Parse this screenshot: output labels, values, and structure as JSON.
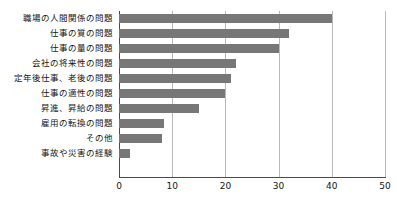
{
  "chart_data": {
    "type": "bar",
    "orientation": "horizontal",
    "title": "",
    "xlabel": "",
    "ylabel": "",
    "xlim": [
      0,
      50
    ],
    "xticks": [
      "0",
      "10",
      "20",
      "30",
      "40",
      "50"
    ],
    "xtick_values": [
      0,
      10,
      20,
      30,
      40,
      50
    ],
    "grid": true,
    "legend": false,
    "bar_color": "#777777",
    "axis_color": "#4a4a4a",
    "gridline_color": "#b9b9b9",
    "background_color": "#ffffff",
    "categories": [
      "職場の人間関係の問題",
      "仕事の質の問題",
      "仕事の量の問題",
      "会社の将来性の問題",
      "定年後仕事、老後の問題",
      "仕事の適性の問題",
      "昇進、昇給の問題",
      "雇用の転換の問題",
      "その他",
      "事故や災害の経験"
    ],
    "values": [
      40,
      32,
      30,
      22,
      21,
      20,
      15,
      8.5,
      8,
      2
    ]
  }
}
